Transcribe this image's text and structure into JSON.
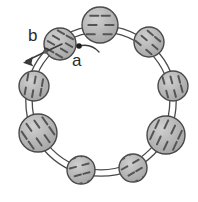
{
  "figure": {
    "type": "schematic-diagram",
    "canvas": {
      "width": 198,
      "height": 202,
      "background": "#ffffff"
    },
    "ring": {
      "center": {
        "x": 101,
        "y": 101
      },
      "radius": 72,
      "bond_style": "double-line",
      "bond_outer_offset": 3.2,
      "bond_color": "#4a4a4a",
      "bond_width": 1.3
    },
    "style": {
      "sphere_fill": "#b0b0b0",
      "sphere_fill_light": "#bdbdbd",
      "sphere_stroke": "#4a4a4a",
      "sphere_stroke_width": 1.4,
      "hatch_color": "#555555",
      "hatch_width": 2.0,
      "annotation_color": "#2b2b2b",
      "text_color": "#2b2b2b"
    },
    "nodes": [
      {
        "id": "n-top",
        "name": "sphere-top",
        "cx": 100,
        "cy": 25,
        "r": 18,
        "hatch_angle": 0,
        "hatch_count": 5,
        "fill": "#bdbdbd"
      },
      {
        "id": "n-upper-right",
        "name": "sphere-upper-right",
        "cx": 149,
        "cy": 42,
        "r": 15,
        "hatch_angle": 40,
        "hatch_count": 5,
        "fill": "#b0b0b0"
      },
      {
        "id": "n-right",
        "name": "sphere-right",
        "cx": 173,
        "cy": 86,
        "r": 15,
        "hatch_angle": 75,
        "hatch_count": 5,
        "fill": "#b0b0b0"
      },
      {
        "id": "n-lower-right",
        "name": "sphere-lower-right",
        "cx": 166,
        "cy": 135,
        "r": 19,
        "hatch_angle": 115,
        "hatch_count": 6,
        "fill": "#b0b0b0"
      },
      {
        "id": "n-bottom-right",
        "name": "sphere-bottom-right",
        "cx": 133,
        "cy": 168,
        "r": 14,
        "hatch_angle": 150,
        "hatch_count": 4,
        "fill": "#b0b0b0"
      },
      {
        "id": "n-bottom-left",
        "name": "sphere-bottom-left",
        "cx": 81,
        "cy": 170,
        "r": 14,
        "hatch_angle": 165,
        "hatch_count": 4,
        "fill": "#b0b0b0"
      },
      {
        "id": "n-lower-left",
        "name": "sphere-lower-left",
        "cx": 38,
        "cy": 133,
        "r": 19,
        "hatch_angle": 55,
        "hatch_count": 6,
        "fill": "#b0b0b0"
      },
      {
        "id": "n-left",
        "name": "sphere-left",
        "cx": 34,
        "cy": 86,
        "r": 15,
        "hatch_angle": 100,
        "hatch_count": 5,
        "fill": "#b0b0b0"
      },
      {
        "id": "n-upper-left",
        "name": "sphere-upper-left",
        "cx": 60,
        "cy": 44,
        "r": 16,
        "hatch_angle": 30,
        "hatch_count": 6,
        "fill": "#b0b0b0"
      }
    ],
    "annotations": {
      "a": {
        "label": "a",
        "name": "lattice-parameter-a",
        "dot": {
          "x": 79,
          "y": 46,
          "r": 2.6
        },
        "leader": {
          "from": {
            "x": 79,
            "y": 46
          },
          "ctrl": {
            "x": 91,
            "y": 44
          },
          "to": {
            "x": 98,
            "y": 52
          }
        },
        "text_pos": {
          "x": 72,
          "y": 52
        }
      },
      "b": {
        "label": "b",
        "name": "lattice-parameter-b",
        "arrow": {
          "from": {
            "x": 62,
            "y": 44
          },
          "to": {
            "x": 25,
            "y": 62
          }
        },
        "arrow_style": "double-headed",
        "text_pos": {
          "x": 28,
          "y": 27
        }
      }
    }
  }
}
